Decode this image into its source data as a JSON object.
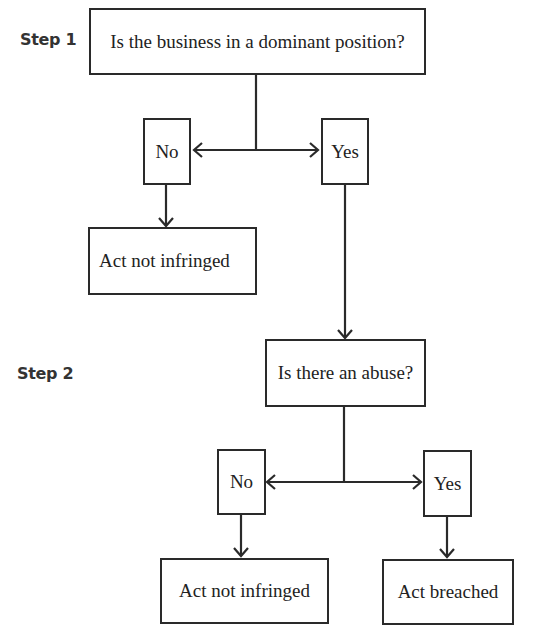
{
  "diagram": {
    "type": "flowchart",
    "step1": {
      "label": "Step 1",
      "question": "Is the business in a dominant position?",
      "no_label": "No",
      "yes_label": "Yes",
      "no_outcome": "Act not infringed"
    },
    "step2": {
      "label": "Step 2",
      "question": "Is there an abuse?",
      "no_label": "No",
      "yes_label": "Yes",
      "no_outcome": "Act not infringed",
      "yes_outcome": "Act breached"
    },
    "colors": {
      "stroke": "#2a2a2a",
      "text": "#222222",
      "background": "#ffffff"
    }
  }
}
